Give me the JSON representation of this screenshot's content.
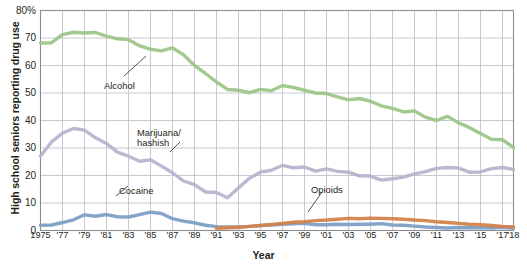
{
  "chart_data": {
    "type": "line",
    "title": "",
    "xlabel": "Year",
    "ylabel": "High school seniors reporting drug use",
    "ylim": [
      0,
      80
    ],
    "yticks": [
      0,
      10,
      20,
      30,
      40,
      50,
      60,
      70,
      80
    ],
    "ytick_labels": [
      "0",
      "10",
      "20",
      "30",
      "40",
      "50",
      "60",
      "70",
      "80%"
    ],
    "xlim": [
      1975,
      2018
    ],
    "xticks": [
      1975,
      1977,
      1979,
      1981,
      1983,
      1985,
      1987,
      1989,
      1991,
      1993,
      1995,
      1997,
      1999,
      2001,
      2003,
      2005,
      2007,
      2009,
      2011,
      2013,
      2015,
      2017,
      2018
    ],
    "xtick_labels": [
      "1975",
      "'77",
      "'79",
      "'81",
      "'83",
      "'85",
      "'87",
      "'89",
      "'91",
      "'93",
      "'95",
      "'97",
      "'99",
      "'01",
      "'03",
      "'05",
      "'07",
      "'09",
      "'11",
      "'13",
      "'15",
      "'17",
      "'18"
    ],
    "grid": true,
    "legend_position": "inline-annotations",
    "x": [
      1975,
      1976,
      1977,
      1978,
      1979,
      1980,
      1981,
      1982,
      1983,
      1984,
      1985,
      1986,
      1987,
      1988,
      1989,
      1990,
      1991,
      1992,
      1993,
      1994,
      1995,
      1996,
      1997,
      1998,
      1999,
      2000,
      2001,
      2002,
      2003,
      2004,
      2005,
      2006,
      2007,
      2008,
      2009,
      2010,
      2011,
      2012,
      2013,
      2014,
      2015,
      2016,
      2017,
      2018
    ],
    "series": [
      {
        "name": "Alcohol",
        "color": "#9ec68a",
        "values": [
          68.2,
          68.3,
          71.2,
          72.1,
          71.8,
          72.0,
          70.7,
          69.7,
          69.4,
          67.2,
          65.9,
          65.3,
          66.4,
          63.9,
          60.0,
          57.1,
          54.0,
          51.3,
          51.0,
          50.1,
          51.3,
          50.8,
          52.7,
          52.0,
          51.0,
          50.0,
          49.8,
          48.6,
          47.5,
          48.0,
          47.0,
          45.3,
          44.4,
          43.1,
          43.5,
          41.2,
          40.0,
          41.5,
          39.2,
          37.4,
          35.3,
          33.2,
          33.0,
          30.2
        ]
      },
      {
        "name": "Marijuana/ hashish",
        "color": "#b5b5cd",
        "values": [
          27.1,
          32.2,
          35.4,
          37.1,
          36.5,
          33.7,
          31.6,
          28.5,
          27.0,
          25.2,
          25.7,
          23.4,
          21.0,
          18.0,
          16.7,
          14.0,
          13.8,
          11.9,
          15.5,
          19.0,
          21.2,
          21.9,
          23.7,
          22.8,
          23.1,
          21.6,
          22.4,
          21.5,
          21.2,
          19.9,
          19.8,
          18.3,
          18.8,
          19.4,
          20.6,
          21.4,
          22.6,
          22.9,
          22.7,
          21.2,
          21.3,
          22.5,
          22.9,
          22.2
        ]
      },
      {
        "name": "Cocaine",
        "color": "#7e9fc6",
        "values": [
          1.9,
          2.0,
          2.9,
          3.9,
          5.7,
          5.2,
          5.8,
          5.0,
          4.9,
          5.8,
          6.7,
          6.2,
          4.3,
          3.4,
          2.8,
          1.9,
          1.4,
          1.3,
          1.3,
          1.5,
          1.8,
          2.0,
          2.3,
          2.4,
          2.6,
          2.1,
          2.1,
          2.3,
          2.2,
          2.3,
          2.3,
          2.5,
          2.0,
          1.9,
          1.6,
          1.3,
          1.1,
          0.9,
          1.1,
          1.0,
          1.1,
          0.9,
          1.2,
          0.8
        ]
      },
      {
        "name": "Opioids",
        "color": "#d4824c",
        "values": [
          null,
          null,
          null,
          null,
          null,
          null,
          null,
          null,
          null,
          null,
          null,
          null,
          null,
          null,
          null,
          null,
          0.8,
          1.0,
          1.2,
          1.5,
          1.8,
          2.2,
          2.6,
          3.0,
          3.2,
          3.6,
          3.8,
          4.1,
          4.4,
          4.3,
          4.5,
          4.4,
          4.3,
          4.1,
          3.8,
          3.6,
          3.2,
          2.9,
          2.6,
          2.3,
          2.1,
          1.8,
          1.5,
          1.3
        ]
      }
    ],
    "annotations": [
      {
        "label": "Alcohol",
        "name": "alcohol"
      },
      {
        "label": "Marijuana/\nhashish",
        "name": "marijuana-hashish"
      },
      {
        "label": "Cocaine",
        "name": "cocaine"
      },
      {
        "label": "Opioids",
        "name": "opioids"
      }
    ]
  },
  "colors": {
    "grid": "#b9bcc4",
    "axis": "#8a8d94",
    "text": "#231f20",
    "background": "#ffffff"
  }
}
